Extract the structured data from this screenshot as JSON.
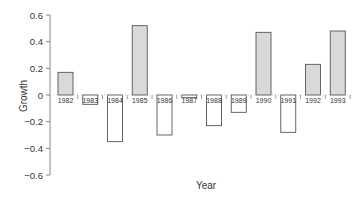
{
  "chart_data": {
    "type": "bar",
    "title": "",
    "xlabel": "Year",
    "ylabel": "Growth",
    "categories": [
      "1982",
      "1983",
      "1984",
      "1985",
      "1986",
      "1987",
      "1988",
      "1989",
      "1990",
      "1991",
      "1992",
      "1993"
    ],
    "values": [
      0.17,
      -0.07,
      -0.35,
      0.52,
      -0.3,
      -0.02,
      -0.23,
      -0.13,
      0.47,
      -0.28,
      0.23,
      0.48
    ],
    "ylim": [
      -0.6,
      0.6
    ],
    "yticks": [
      0.6,
      0.4,
      0.2,
      0,
      -0.2,
      -0.4,
      -0.6
    ],
    "ytick_labels": [
      "0.6",
      "0.4",
      "0.2",
      "0",
      "−0.2",
      "−0.4",
      "−0.6"
    ],
    "grid": false,
    "legend": null,
    "colors": {
      "positive_fill": "#d9d9d9",
      "negative_fill": "#ffffff",
      "stroke": "#555555",
      "axis": "#888888"
    },
    "annotations": "Year labels are placed along the zero line inside each bar's slot"
  }
}
